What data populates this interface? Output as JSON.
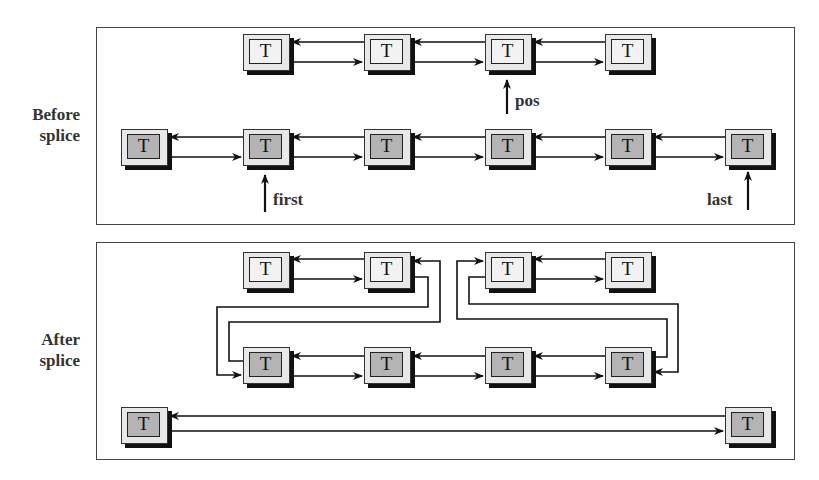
{
  "labels": {
    "before": "Before\nsplice",
    "before_line1": "Before",
    "before_line2": "splice",
    "after_line1": "After",
    "after_line2": "splice"
  },
  "node_label": "T",
  "pointers": {
    "pos": "pos",
    "first": "first",
    "last": "last"
  },
  "before": {
    "list_upper": [
      "T",
      "T",
      "T",
      "T"
    ],
    "list_lower": [
      "T",
      "T",
      "T",
      "T",
      "T",
      "T"
    ]
  },
  "after": {
    "row_upper": [
      "T",
      "T",
      "T",
      "T"
    ],
    "row_middle": [
      "T",
      "T",
      "T",
      "T"
    ],
    "row_bottom": [
      "T",
      "T"
    ]
  }
}
